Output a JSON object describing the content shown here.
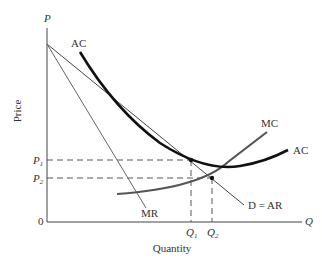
{
  "diagram": {
    "axes": {
      "y_axis_symbol": "P",
      "x_axis_symbol": "Q",
      "y_axis_label": "Price",
      "x_axis_label": "Quantity",
      "origin_label": "0"
    },
    "curves": {
      "ac_left_label": "AC",
      "ac_right_label": "AC",
      "mc_label": "MC",
      "mr_label": "MR",
      "demand_label": "D = AR"
    },
    "price_ticks": {
      "p1": "P",
      "p1_sub": "1",
      "p2": "P",
      "p2_sub": "2"
    },
    "quantity_ticks": {
      "q1": "Q",
      "q1_sub": "1",
      "q2": "Q",
      "q2_sub": "2"
    },
    "colors": {
      "ac": "#111111",
      "mc": "#555555",
      "demand": "#444444",
      "mr": "#666666",
      "axes": "#444444",
      "dashed": "#444444"
    }
  }
}
